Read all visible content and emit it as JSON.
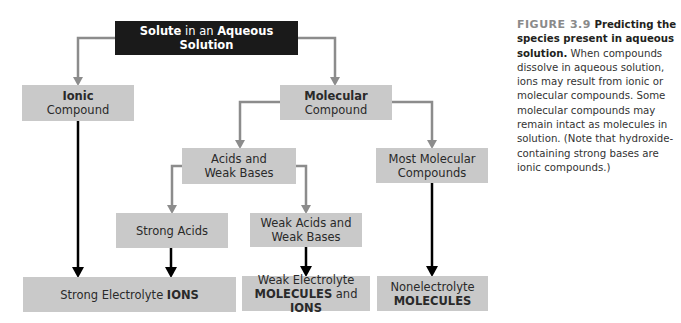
{
  "diagram": {
    "title": {
      "part1": "Solute",
      "part2": " in an ",
      "part3": "Aqueous Solution"
    },
    "nodes": {
      "ionic": {
        "bold": "Ionic",
        "text": "Compound"
      },
      "molecular": {
        "bold": "Molecular",
        "text": "Compound"
      },
      "acids_weak_bases": {
        "line1": "Acids and",
        "line2": "Weak Bases"
      },
      "most_molecular": {
        "line1": "Most Molecular",
        "line2": "Compounds"
      },
      "strong_acids": {
        "text": "Strong Acids"
      },
      "weak_acids_bases": {
        "line1": "Weak Acids and",
        "line2": "Weak Bases"
      },
      "strong_electrolyte": {
        "text": "Strong Electrolyte ",
        "bold": "IONS"
      },
      "weak_electrolyte": {
        "line1": "Weak Electrolyte",
        "bold1": "MOLECULES",
        "mid": " and ",
        "bold2": "IONS"
      },
      "nonelectrolyte": {
        "line1": "Nonelectrolyte",
        "bold": "MOLECULES"
      }
    },
    "colors": {
      "box_fill": "#c9c9c9",
      "title_fill": "#1a1a1a",
      "gray_arrow": "#8c8c8c",
      "black_arrow": "#000000"
    }
  },
  "caption": {
    "figure_label": "FIGURE 3.9",
    "title": " Predicting the species present in aqueous solution.",
    "body": " When compounds dissolve in aqueous solution, ions may result from ionic or molecular compounds. Some molecular compounds may remain intact as molecules in solution. (Note that hydroxide-containing strong bases are ionic compounds.)"
  }
}
